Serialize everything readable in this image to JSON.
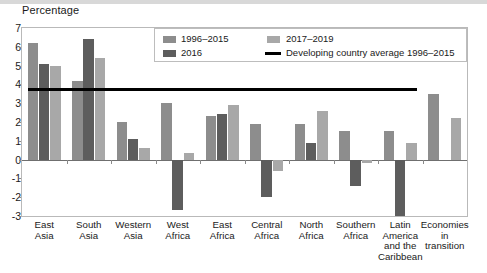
{
  "axis_title": "Percentage",
  "legend": {
    "items": [
      {
        "label": "1996–2015",
        "type": "swatch",
        "color": "#8d8d8d"
      },
      {
        "label": "2017–2019",
        "type": "swatch",
        "color": "#a8a8a8"
      },
      {
        "label": "2016",
        "type": "swatch",
        "color": "#5d5d5d"
      },
      {
        "label": "Developing country average 1996–2015",
        "type": "line",
        "color": "#000000"
      }
    ]
  },
  "chart_data": {
    "type": "bar",
    "title": "",
    "xlabel": "",
    "ylabel": "Percentage",
    "ylim": [
      -3,
      7
    ],
    "yticks": [
      7,
      6,
      5,
      4,
      3,
      2,
      1,
      0,
      -1,
      -2,
      -3
    ],
    "grid": false,
    "legend_position": "top-right-inside",
    "categories": [
      "East Asia",
      "South Asia",
      "Western Asia",
      "West Africa",
      "East Africa",
      "Central Africa",
      "North Africa",
      "Southern Africa",
      "Latin America and the Caribbean",
      "Economies in transition"
    ],
    "category_lines": [
      [
        "East",
        "Asia"
      ],
      [
        "South",
        "Asia"
      ],
      [
        "Western",
        "Asia"
      ],
      [
        "West",
        "Africa"
      ],
      [
        "East",
        "Africa"
      ],
      [
        "Central",
        "Africa"
      ],
      [
        "North",
        "Africa"
      ],
      [
        "Southern",
        "Africa"
      ],
      [
        "Latin",
        "America",
        "and the",
        "Caribbean"
      ],
      [
        "Economies",
        "in",
        "transition"
      ]
    ],
    "series": [
      {
        "name": "1996–2015",
        "color": "#8d8d8d",
        "values": [
          6.2,
          4.2,
          2.0,
          3.0,
          2.3,
          1.9,
          1.9,
          1.5,
          1.5,
          3.5
        ]
      },
      {
        "name": "2016",
        "color": "#5d5d5d",
        "values": [
          5.1,
          6.4,
          1.1,
          -2.7,
          2.4,
          -2.0,
          0.9,
          -1.4,
          -3.0,
          0.0
        ]
      },
      {
        "name": "2017–2019",
        "color": "#a8a8a8",
        "values": [
          5.0,
          5.4,
          0.6,
          0.35,
          2.9,
          -0.6,
          2.6,
          -0.2,
          0.9,
          2.2
        ]
      }
    ],
    "reference_line": {
      "label": "Developing country average 1996–2015",
      "value": 3.75,
      "color": "#000000",
      "spans_categories": [
        0,
        8
      ]
    }
  }
}
